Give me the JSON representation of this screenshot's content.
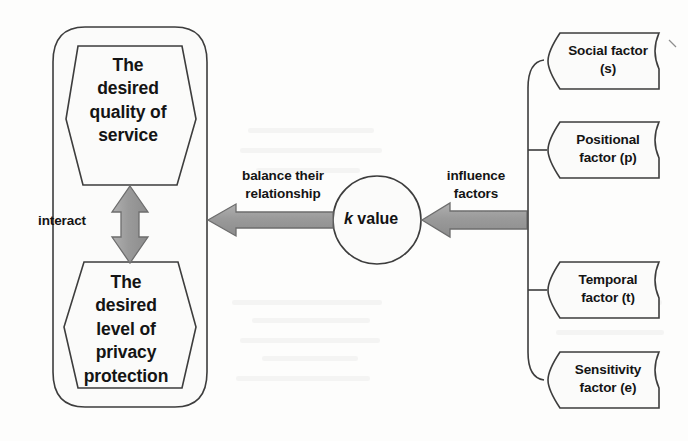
{
  "diagram": {
    "colors": {
      "stroke": "#3d3d3d",
      "shape_fill": "#fbfbfa",
      "arrow_fill": "#9c9c9c",
      "arrow_stroke": "#6d6d6d",
      "text": "#141414",
      "background": "#fdfdfc"
    },
    "left_group": {
      "name": "interacting-desires-container",
      "nodes": [
        {
          "id": "quality-of-service",
          "shape": "hexagon",
          "label": "The\ndesired\nquality of\nservice"
        },
        {
          "id": "privacy-protection",
          "shape": "hexagon",
          "label": "The\ndesired\nlevel of\nprivacy\nprotection"
        }
      ],
      "connector": {
        "id": "interact-arrow",
        "label": "interact",
        "style": "double-headed-vertical-arrow"
      }
    },
    "center": {
      "id": "k-value-node",
      "shape": "circle",
      "label_italic": "k",
      "label_rest": " value"
    },
    "edges": [
      {
        "id": "balance-edge",
        "label": "balance their\nrelationship",
        "from": "k-value-node",
        "to": "interacting-desires-container",
        "direction": "left"
      },
      {
        "id": "influence-edge",
        "label": "influence\nfactors",
        "from": "factors-bracket",
        "to": "k-value-node",
        "direction": "left"
      }
    ],
    "right_group": {
      "name": "factors-bracket",
      "factors": [
        {
          "id": "social-factor",
          "label": "Social factor\n(s)"
        },
        {
          "id": "positional-factor",
          "label": "Positional\nfactor (p)"
        },
        {
          "id": "temporal-factor",
          "label": "Temporal\nfactor (t)"
        },
        {
          "id": "sensitivity-factor",
          "label": "Sensitivity\nfactor (e)"
        }
      ]
    }
  }
}
